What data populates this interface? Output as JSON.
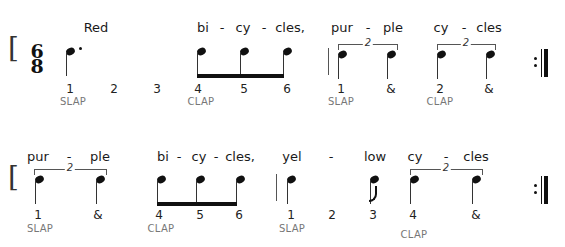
{
  "time_signature": {
    "top": "6",
    "bottom": "8"
  },
  "rows": [
    {
      "lyrics": [
        {
          "text": "Red",
          "x": 96
        },
        {
          "text": "bi",
          "x": 203
        },
        {
          "text": "-",
          "x": 222
        },
        {
          "text": "cy",
          "x": 243
        },
        {
          "text": "-",
          "x": 264
        },
        {
          "text": "cles,",
          "x": 290
        },
        {
          "text": "pur",
          "x": 342
        },
        {
          "text": "-",
          "x": 368
        },
        {
          "text": "ple",
          "x": 393
        },
        {
          "text": "cy",
          "x": 441
        },
        {
          "text": "-",
          "x": 464
        },
        {
          "text": "cles",
          "x": 489
        }
      ],
      "counts": [
        {
          "text": "1",
          "x": 70
        },
        {
          "text": "2",
          "x": 114
        },
        {
          "text": "3",
          "x": 157
        },
        {
          "text": "4",
          "x": 198
        },
        {
          "text": "5",
          "x": 244
        },
        {
          "text": "6",
          "x": 287
        },
        {
          "text": "1",
          "x": 341
        },
        {
          "text": "&",
          "x": 391
        },
        {
          "text": "2",
          "x": 440
        },
        {
          "text": "&",
          "x": 489
        }
      ],
      "labels": [
        {
          "text": "SLAP",
          "x": 73
        },
        {
          "text": "CLAP",
          "x": 201
        },
        {
          "text": "SLAP",
          "x": 341
        },
        {
          "text": "CLAP",
          "x": 440
        }
      ],
      "tuplets": [
        {
          "number": "2",
          "x1": 338,
          "x2": 396
        },
        {
          "number": "2",
          "x1": 437,
          "x2": 494
        }
      ]
    },
    {
      "lyrics": [
        {
          "text": "pur",
          "x": 38
        },
        {
          "text": "-",
          "x": 69
        },
        {
          "text": "ple",
          "x": 100
        },
        {
          "text": "bi",
          "x": 163
        },
        {
          "text": "-",
          "x": 179
        },
        {
          "text": "cy",
          "x": 199
        },
        {
          "text": "-",
          "x": 216
        },
        {
          "text": "cles,",
          "x": 240
        },
        {
          "text": "yel",
          "x": 292
        },
        {
          "text": "-",
          "x": 331
        },
        {
          "text": "low",
          "x": 375
        },
        {
          "text": "cy",
          "x": 415
        },
        {
          "text": "-",
          "x": 446
        },
        {
          "text": "cles",
          "x": 476
        }
      ],
      "counts": [
        {
          "text": "1",
          "x": 38
        },
        {
          "text": "&",
          "x": 98
        },
        {
          "text": "4",
          "x": 159
        },
        {
          "text": "5",
          "x": 200
        },
        {
          "text": "6",
          "x": 239
        },
        {
          "text": "1",
          "x": 291
        },
        {
          "text": "2",
          "x": 332
        },
        {
          "text": "3",
          "x": 373
        },
        {
          "text": "4",
          "x": 413
        },
        {
          "text": "&",
          "x": 476
        }
      ],
      "labels": [
        {
          "text": "SLAP",
          "x": 40
        },
        {
          "text": "CLAP",
          "x": 161
        },
        {
          "text": "SLAP",
          "x": 292
        },
        {
          "text": "CLAP",
          "x": 414
        }
      ],
      "tuplets": [
        {
          "number": "2",
          "x1": 34,
          "x2": 105
        },
        {
          "number": "2",
          "x1": 410,
          "x2": 481
        }
      ]
    }
  ]
}
